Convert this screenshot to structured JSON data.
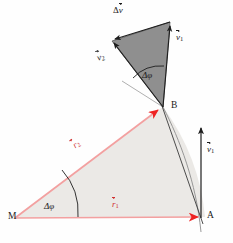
{
  "figure": {
    "colors": {
      "radius_line": "#f3a0a0",
      "radius_arrowhead": "#ee2222",
      "sector_fill": "#ebe9e6",
      "velocity_triangle_fill": "#8f8f8f",
      "outline": "#2b2b2b",
      "label_red": "#cf3030",
      "label_black": "#1a1a1a",
      "background": "#fefefe"
    },
    "points": [
      {
        "id": "M",
        "label": "M",
        "x": 14,
        "y": 218,
        "role": "circle-center"
      },
      {
        "id": "A",
        "label": "A",
        "x": 205,
        "y": 217,
        "role": "point-on-path"
      },
      {
        "id": "B",
        "label": "B",
        "x": 171,
        "y": 107,
        "role": "point-on-path"
      }
    ],
    "vectors": [
      {
        "id": "r1",
        "symbol": "r",
        "sub": "1",
        "label_x": 112,
        "label_y": 201,
        "color": "red",
        "from": "M",
        "to": "A",
        "meaning": "position vector to A"
      },
      {
        "id": "r2",
        "symbol": "r",
        "sub": "2",
        "label_x": 72,
        "label_y": 145,
        "color": "red",
        "from": "M",
        "to": "B",
        "meaning": "position vector to B"
      },
      {
        "id": "v1_at_A",
        "symbol": "v",
        "sub": "1",
        "label_x": 207,
        "label_y": 146,
        "color": "black",
        "at": "A",
        "meaning": "velocity at A, tangent to path"
      },
      {
        "id": "v1_triangle",
        "symbol": "v",
        "sub": "1",
        "label_x": 176,
        "label_y": 33,
        "color": "black",
        "meaning": "velocity v1 translated into vector triangle"
      },
      {
        "id": "v2_triangle",
        "symbol": "v",
        "sub": "2",
        "label_x": 97,
        "label_y": 56,
        "color": "black",
        "rotated": true,
        "meaning": "velocity v2 in vector triangle"
      },
      {
        "id": "dv",
        "symbol": "v",
        "prefix": "Δ",
        "label_x": 113,
        "label_y": 6,
        "color": "black",
        "meaning": "change in velocity"
      }
    ],
    "angles": [
      {
        "id": "dphi_top",
        "label": "Δφ",
        "x": 142,
        "y": 72,
        "meaning": "angle between v1 and v2"
      },
      {
        "id": "dphi_bottom",
        "label": "Δφ",
        "x": 44,
        "y": 203,
        "meaning": "angle between r1 and r2 at center M"
      }
    ]
  }
}
